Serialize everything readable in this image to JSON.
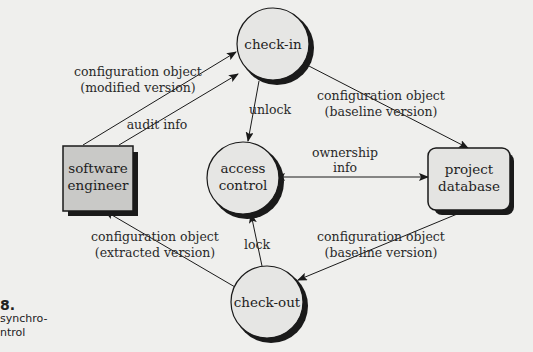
{
  "figure": {
    "caption_number": "8.",
    "caption_lines": [
      "synchro-",
      "ntrol"
    ]
  },
  "nodes": {
    "check_in": {
      "label": "check-in",
      "shape": "circle"
    },
    "access_control": {
      "label_lines": [
        "access",
        "control"
      ],
      "shape": "circle"
    },
    "check_out": {
      "label": "check-out",
      "shape": "circle"
    },
    "software_engineer": {
      "label_lines": [
        "software",
        "engineer"
      ],
      "shape": "box"
    },
    "project_database": {
      "label_lines": [
        "project",
        "database"
      ],
      "shape": "rounded-box"
    }
  },
  "edges": {
    "modified": {
      "from": "software engineer",
      "to": "check-in",
      "label_lines": [
        "configuration object",
        "(modified version)"
      ]
    },
    "audit": {
      "from": "software engineer",
      "to": "check-in",
      "label": "audit info"
    },
    "unlock": {
      "from": "check-in",
      "to": "access control",
      "label": "unlock"
    },
    "baseline_in": {
      "from": "check-in",
      "to": "project database",
      "label_lines": [
        "configuration object",
        "(baseline version)"
      ]
    },
    "ownership": {
      "from": "access control",
      "to": "project database",
      "bidirectional": true,
      "label_lines": [
        "ownership",
        "info"
      ]
    },
    "lock": {
      "from": "check-out",
      "to": "access control",
      "label": "lock"
    },
    "extracted": {
      "from": "check-out",
      "to": "software engineer",
      "label_lines": [
        "configuration object",
        "(extracted version)"
      ]
    },
    "baseline_out": {
      "from": "project database",
      "to": "check-out",
      "label_lines": [
        "configuration object",
        "(baseline version)"
      ]
    }
  },
  "colors": {
    "background": "#efefed",
    "node_fill_circle": "#e6e6e4",
    "node_fill_box": "#c9c9c7",
    "node_fill_db": "#e4e4e2",
    "stroke": "#1a1a1a",
    "shadow": "#1a1a1a"
  }
}
